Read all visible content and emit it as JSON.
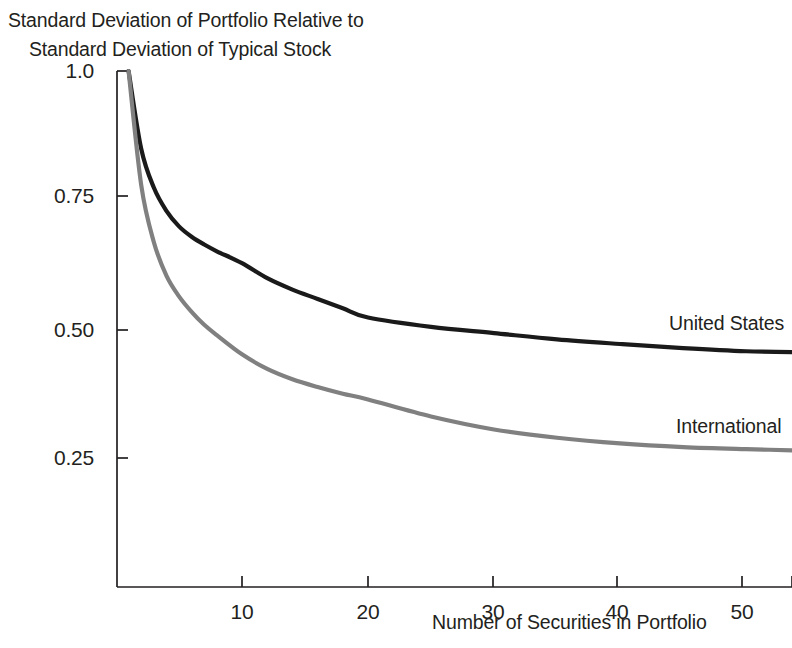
{
  "figure": {
    "title_line_1": "Standard Deviation of Portfolio Relative to",
    "title_line_2": "Standard Deviation of Typical Stock",
    "background_color": "#ffffff",
    "axis_color": "#231f20",
    "text_color": "#231f20"
  },
  "axes": {
    "x_title": "Number of Securities in Portfolio",
    "x_tick_labels": [
      "10",
      "20",
      "30",
      "40",
      "50"
    ],
    "y_tick_labels": [
      "1.0",
      "0.75",
      "0.50",
      "0.25"
    ]
  },
  "series_labels": {
    "united_states": "United States",
    "international": "International"
  },
  "chart_data": {
    "type": "line",
    "title": "Standard Deviation of Portfolio Relative to Standard Deviation of Typical Stock",
    "xlabel": "Number of Securities in Portfolio",
    "ylabel": "Standard Deviation of Portfolio Relative to Standard Deviation of Typical Stock",
    "xlim": [
      1,
      55
    ],
    "ylim": [
      0,
      1.0
    ],
    "xticks": [
      10,
      20,
      30,
      40,
      50
    ],
    "xticklabels": [
      "10",
      "20",
      "30",
      "40",
      "50"
    ],
    "yticks": [
      0.25,
      0.5,
      0.75,
      1.0
    ],
    "yticklabels": [
      "0.25",
      "0.50",
      "0.75",
      "1.0"
    ],
    "grid": false,
    "legend": "inline-right",
    "x": [
      1,
      2,
      3,
      4,
      5,
      6,
      7,
      8,
      10,
      12,
      14,
      16,
      18,
      20,
      25,
      30,
      35,
      40,
      45,
      50,
      55
    ],
    "series": [
      {
        "name": "United States",
        "color": "#1a1a1a",
        "label_color": "#231f20",
        "line_width": 4.2,
        "asymptote": 0.45,
        "values": [
          1.0,
          0.85,
          0.775,
          0.73,
          0.7,
          0.68,
          0.665,
          0.652,
          0.629,
          0.6,
          0.578,
          0.56,
          0.542,
          0.524,
          0.506,
          0.494,
          0.482,
          0.473,
          0.465,
          0.459,
          0.457
        ]
      },
      {
        "name": "International",
        "color": "#808080",
        "label_color": "#231f20",
        "line_width": 4.2,
        "asymptote": 0.26,
        "values": [
          1.0,
          0.78,
          0.67,
          0.605,
          0.565,
          0.535,
          0.51,
          0.49,
          0.453,
          0.425,
          0.405,
          0.39,
          0.377,
          0.366,
          0.333,
          0.308,
          0.292,
          0.281,
          0.274,
          0.27,
          0.267
        ]
      }
    ]
  },
  "geometry": {
    "plot_left_px": 117,
    "plot_bottom_px": 587,
    "plot_right_px": 792,
    "y_value_1_0_px": 71,
    "y_value_0_75_px": 196,
    "y_value_0_50_px": 330,
    "y_value_0_25_px": 458,
    "x_tick_px": [
      242,
      368,
      493,
      617,
      742,
      792
    ],
    "tick_length_px": 11
  }
}
